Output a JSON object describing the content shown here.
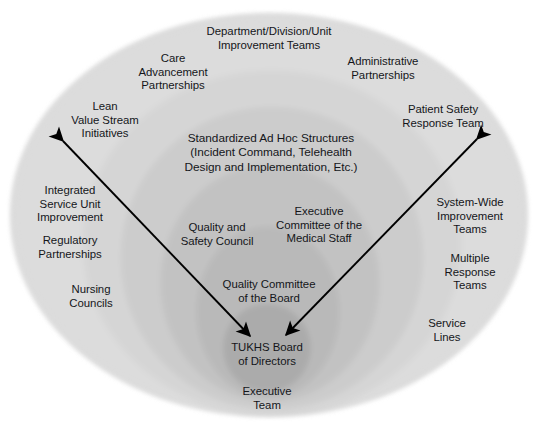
{
  "diagram": {
    "center_label": "TUKHS Board\nof Directors",
    "colors": {
      "background": "#ffffff",
      "ring_outer": "#dcdcdc",
      "ring_2": "#d2d2d2",
      "ring_3": "#c8c8c8",
      "ring_4": "#bebebe",
      "ring_5": "#b4b4b4",
      "ring_core": "#a8a8a8",
      "text": "#14161a",
      "arrow": "#000000"
    },
    "rings": [
      {
        "name": "outer-ellipse",
        "cx": 269,
        "cy": 215,
        "rx": 259,
        "ry": 202,
        "fill": "#dcdcdc"
      },
      {
        "name": "ring-2-ellipse",
        "cx": 272,
        "cy": 243,
        "rx": 190,
        "ry": 173,
        "fill": "#d5d5d5"
      },
      {
        "name": "ring-3-ellipse",
        "cx": 272,
        "cy": 258,
        "rx": 152,
        "ry": 152,
        "fill": "#cccccc"
      },
      {
        "name": "ring-4-ellipse",
        "cx": 270,
        "cy": 283,
        "rx": 110,
        "ry": 119,
        "fill": "#c2c2c2"
      },
      {
        "name": "ring-5-ellipse",
        "cx": 268,
        "cy": 312,
        "rx": 72,
        "ry": 86,
        "fill": "#b9b9b9"
      },
      {
        "name": "core-ellipse",
        "cx": 267,
        "cy": 348,
        "rx": 44,
        "ry": 44,
        "fill": "#ababab"
      }
    ],
    "arrows": [
      {
        "name": "arrow-left-diagonal",
        "x1": 63,
        "y1": 141,
        "x2": 250,
        "y2": 336
      },
      {
        "name": "arrow-right-diagonal",
        "x1": 477,
        "y1": 139,
        "x2": 286,
        "y2": 335
      }
    ],
    "labels": [
      {
        "id": "department-division-unit-improvement-teams",
        "text": "Department/Division/Unit\nImprovement Teams",
        "x": 269,
        "y": 39
      },
      {
        "id": "care-advancement-partnerships",
        "text": "Care\nAdvancement\nPartnerships",
        "x": 173,
        "y": 72
      },
      {
        "id": "administrative-partnerships",
        "text": "Administrative\nPartnerships",
        "x": 383,
        "y": 69
      },
      {
        "id": "lean-value-stream-initiatives",
        "text": "Lean\nValue Stream\nInitiatives",
        "x": 105,
        "y": 120
      },
      {
        "id": "patient-safety-response-team",
        "text": "Patient Safety\nResponse Team",
        "x": 443,
        "y": 117
      },
      {
        "id": "standardized-ad-hoc-structures",
        "text": "Standardized Ad Hoc Structures\n(Incident Command, Telehealth\nDesign and Implementation, Etc.)",
        "x": 271,
        "y": 153
      },
      {
        "id": "integrated-service-unit-improvement",
        "text": "Integrated\nService Unit\nImprovement",
        "x": 70,
        "y": 204
      },
      {
        "id": "system-wide-improvement-teams",
        "text": "System-Wide\nImprovement\nTeams",
        "x": 470,
        "y": 216
      },
      {
        "id": "quality-and-safety-council",
        "text": "Quality and\nSafety Council",
        "x": 217,
        "y": 235
      },
      {
        "id": "executive-committee-of-the-medical-staff",
        "text": "Executive\nCommittee of the\nMedical Staff",
        "x": 319,
        "y": 225
      },
      {
        "id": "regulatory-partnerships",
        "text": "Regulatory\nPartnerships",
        "x": 70,
        "y": 248
      },
      {
        "id": "multiple-response-teams",
        "text": "Multiple\nResponse\nTeams",
        "x": 470,
        "y": 272
      },
      {
        "id": "quality-committee-of-the-board",
        "text": "Quality Committee\nof the Board",
        "x": 269,
        "y": 292
      },
      {
        "id": "nursing-councils",
        "text": "Nursing\nCouncils",
        "x": 91,
        "y": 297
      },
      {
        "id": "service-lines",
        "text": "Service\nLines",
        "x": 447,
        "y": 331
      },
      {
        "id": "tukhs-board-of-directors",
        "text": "TUKHS Board\nof Directors",
        "x": 267,
        "y": 355
      },
      {
        "id": "executive-team",
        "text": "Executive\nTeam",
        "x": 267,
        "y": 399
      }
    ]
  }
}
